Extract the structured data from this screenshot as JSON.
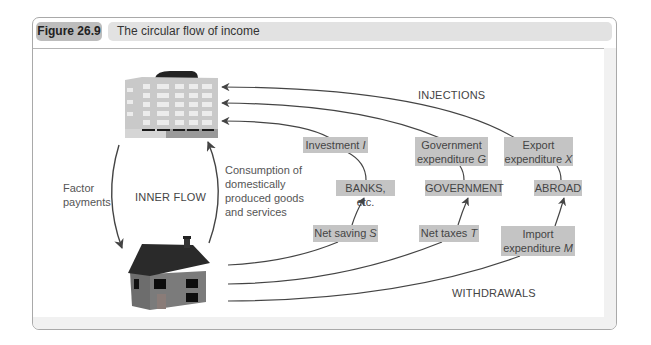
{
  "figure": {
    "number": "Figure 26.9",
    "title": "The circular flow of income"
  },
  "nodes": {
    "firms_icon": "office-building-icon",
    "households_icon": "house-icon"
  },
  "inner_flow": {
    "label": "INNER FLOW",
    "factor_payments": [
      "Factor",
      "payments"
    ],
    "consumption": [
      "Consumption of",
      "domestically",
      "produced goods",
      "and services"
    ]
  },
  "injections": {
    "label": "INJECTIONS",
    "items": [
      {
        "text": "Investment",
        "symbol": "I"
      },
      {
        "text_line1": "Government",
        "text_line2": "expenditure",
        "symbol": "G"
      },
      {
        "text_line1": "Export",
        "text_line2": "expenditure",
        "symbol": "X"
      }
    ]
  },
  "sectors": [
    "BANKS, etc.",
    "GOVERNMENT",
    "ABROAD"
  ],
  "withdrawals": {
    "label": "WITHDRAWALS",
    "items": [
      {
        "text": "Net saving",
        "symbol": "S"
      },
      {
        "text": "Net taxes",
        "symbol": "T"
      },
      {
        "text_line1": "Import",
        "text_line2": "expenditure",
        "symbol": "M"
      }
    ]
  },
  "colors": {
    "label_box": "#c4c4c4",
    "fig_number_bg": "#bdbdbd",
    "title_bg": "#e2e2e2",
    "arrow": "#444444",
    "frame_border": "#a9a9a9"
  }
}
